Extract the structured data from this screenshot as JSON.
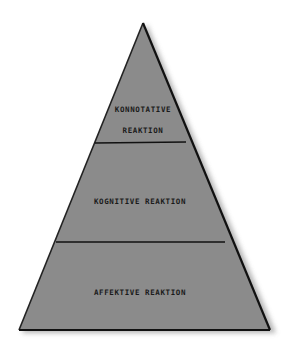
{
  "diagram": {
    "type": "pyramid",
    "colors": {
      "fill": "#8b8b8b",
      "outline": "#111111",
      "shadow": "#b0b0b0",
      "background": "#ffffff",
      "text": "#1a1a1a"
    },
    "levels": [
      {
        "position": "top",
        "label_line1": "KONNOTATIVE",
        "label_line2": "REAKTION"
      },
      {
        "position": "middle",
        "label": "KOGNITIVE REAKTION"
      },
      {
        "position": "bottom",
        "label": "AFFEKTIVE REAKTION"
      }
    ]
  }
}
